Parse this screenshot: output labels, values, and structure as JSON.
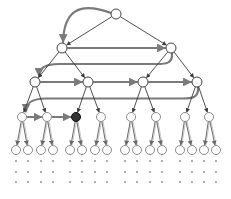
{
  "diagram": {
    "title": "",
    "type": "binary-tree-traversal",
    "colors": {
      "edge": "#3a3a3a",
      "leaf_edge": "#6a6a6a",
      "traversal_arrow": "#7a7a7a",
      "node_fill": "#ffffff",
      "node_stroke": "#444444",
      "leaf_stroke": "#8a8a8a",
      "highlight_fill": "#333333",
      "dot": "#8a8a8a"
    },
    "levels": [
      {
        "level": 0,
        "y": 14,
        "r": 5,
        "nodes": [
          116
        ]
      },
      {
        "level": 1,
        "y": 48,
        "r": 5,
        "nodes": [
          62,
          171
        ]
      },
      {
        "level": 2,
        "y": 82,
        "r": 5,
        "nodes": [
          35,
          88,
          143,
          197
        ]
      },
      {
        "level": 3,
        "y": 117,
        "r": 4.5,
        "nodes": [
          22,
          47,
          76,
          101,
          131,
          156,
          185,
          209
        ]
      },
      {
        "level": 4,
        "y": 150,
        "r": 4.5,
        "nodes": [
          16,
          28,
          41,
          53,
          70,
          82,
          95,
          107,
          125,
          137,
          150,
          162,
          180,
          192,
          204,
          216
        ]
      }
    ],
    "highlighted_node": {
      "level": 3,
      "index": 2,
      "label": "current"
    },
    "ellipsis_rows_y": [
      161,
      172,
      182
    ],
    "traversal_arrows": [
      {
        "from": [
          0,
          0
        ],
        "to": [
          1,
          0
        ],
        "shape": "curve"
      },
      {
        "from": [
          1,
          0
        ],
        "to": [
          1,
          1
        ],
        "shape": "straight"
      },
      {
        "from": [
          1,
          1
        ],
        "to": [
          2,
          0
        ],
        "shape": "wrap"
      },
      {
        "from": [
          2,
          0
        ],
        "to": [
          2,
          1
        ],
        "shape": "straight"
      },
      {
        "from": [
          2,
          1
        ],
        "to": [
          2,
          2
        ],
        "shape": "straight"
      },
      {
        "from": [
          2,
          2
        ],
        "to": [
          2,
          3
        ],
        "shape": "straight"
      },
      {
        "from": [
          2,
          3
        ],
        "to": [
          3,
          0
        ],
        "shape": "wrap"
      },
      {
        "from": [
          3,
          0
        ],
        "to": [
          3,
          1
        ],
        "shape": "straight"
      },
      {
        "from": [
          3,
          1
        ],
        "to": [
          3,
          2
        ],
        "shape": "straight"
      }
    ]
  }
}
